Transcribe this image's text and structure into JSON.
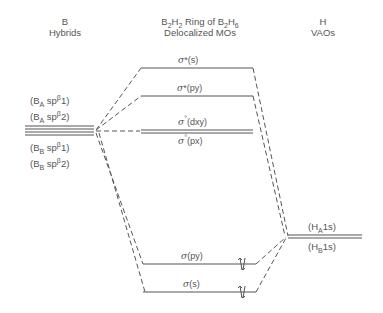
{
  "headers": {
    "left": {
      "line1": "B",
      "line2": "Hybrids"
    },
    "center": {
      "line1_pre": "B",
      "line1_s1": "2",
      "line1_h": "H",
      "line1_s2": "2",
      "line1_mid": " Ring of  B",
      "line1_s3": "2",
      "line1_h2": "H",
      "line1_s4": "6",
      "line2": "Delocalized MOs"
    },
    "right": {
      "line1": "H",
      "line2": "VAOs"
    }
  },
  "b_hybrids": [
    {
      "open": "(B",
      "sub": "A",
      "mid": " sp",
      "sup": "β",
      "end": "1)"
    },
    {
      "open": "(B",
      "sub": "A",
      "mid": " sp",
      "sup": "β",
      "end": "2)"
    },
    {
      "open": "(B",
      "sub": "B",
      "mid": " sp",
      "sup": "β",
      "end": "1)"
    },
    {
      "open": "(B",
      "sub": "B",
      "mid": " sp",
      "sup": "β",
      "end": "2)"
    }
  ],
  "h_vaos": [
    {
      "open": "(H",
      "sub": "A",
      "end": "1s)"
    },
    {
      "open": "(H",
      "sub": "B",
      "end": "1s)"
    }
  ],
  "mos": [
    {
      "sigma": "σ",
      "mark": "*",
      "orb": "(s)",
      "occupied": false
    },
    {
      "sigma": "σ",
      "mark": "*",
      "orb": "(py)",
      "occupied": false
    },
    {
      "sigma": "σ",
      "mark": "°",
      "orb": "(dxy)",
      "occupied": false
    },
    {
      "sigma": "σ",
      "mark": "°",
      "orb": "(px)",
      "occupied": false
    },
    {
      "sigma": "σ",
      "mark": "",
      "orb": "(py)",
      "occupied": true
    },
    {
      "sigma": "σ",
      "mark": "",
      "orb": "(s)",
      "occupied": true
    }
  ],
  "colors": {
    "line": "#555555",
    "text": "#555555"
  }
}
